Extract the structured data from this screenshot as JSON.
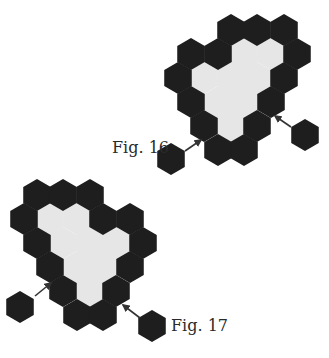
{
  "figures": [
    {
      "id": "fig16",
      "label": "Fig. 16",
      "label_pos": {
        "x": 112,
        "y": 140
      },
      "hex_cells": [
        {
          "x": 231,
          "y": 30,
          "fill": "dark"
        },
        {
          "x": 257,
          "y": 30,
          "fill": "dark"
        },
        {
          "x": 284,
          "y": 30,
          "fill": "dark"
        },
        {
          "x": 191,
          "y": 54,
          "fill": "dark"
        },
        {
          "x": 218,
          "y": 54,
          "fill": "dark"
        },
        {
          "x": 244,
          "y": 54,
          "fill": "light"
        },
        {
          "x": 271,
          "y": 54,
          "fill": "light"
        },
        {
          "x": 297,
          "y": 54,
          "fill": "dark"
        },
        {
          "x": 178,
          "y": 78,
          "fill": "dark"
        },
        {
          "x": 204,
          "y": 78,
          "fill": "light"
        },
        {
          "x": 231,
          "y": 78,
          "fill": "light"
        },
        {
          "x": 257,
          "y": 78,
          "fill": "light"
        },
        {
          "x": 284,
          "y": 78,
          "fill": "dark"
        },
        {
          "x": 191,
          "y": 102,
          "fill": "dark"
        },
        {
          "x": 218,
          "y": 102,
          "fill": "light"
        },
        {
          "x": 244,
          "y": 102,
          "fill": "light"
        },
        {
          "x": 271,
          "y": 102,
          "fill": "dark"
        },
        {
          "x": 204,
          "y": 126,
          "fill": "dark"
        },
        {
          "x": 231,
          "y": 126,
          "fill": "light"
        },
        {
          "x": 257,
          "y": 126,
          "fill": "dark"
        },
        {
          "x": 218,
          "y": 150,
          "fill": "dark"
        },
        {
          "x": 244,
          "y": 150,
          "fill": "dark"
        }
      ],
      "loose_hexes": [
        {
          "x": 171,
          "y": 159
        },
        {
          "x": 305,
          "y": 135
        }
      ],
      "arrows": [
        {
          "x1": 185,
          "y1": 151,
          "x2": 201,
          "y2": 140
        },
        {
          "x1": 291,
          "y1": 127,
          "x2": 275,
          "y2": 116
        }
      ]
    },
    {
      "id": "fig17",
      "label": "Fig. 17",
      "label_pos": {
        "x": 171,
        "y": 318
      },
      "hex_cells": [
        {
          "x": 37,
          "y": 195,
          "fill": "dark"
        },
        {
          "x": 63,
          "y": 195,
          "fill": "dark"
        },
        {
          "x": 90,
          "y": 195,
          "fill": "dark"
        },
        {
          "x": 24,
          "y": 219,
          "fill": "dark"
        },
        {
          "x": 50,
          "y": 219,
          "fill": "light"
        },
        {
          "x": 77,
          "y": 219,
          "fill": "light"
        },
        {
          "x": 103,
          "y": 219,
          "fill": "dark"
        },
        {
          "x": 130,
          "y": 219,
          "fill": "dark"
        },
        {
          "x": 37,
          "y": 243,
          "fill": "dark"
        },
        {
          "x": 63,
          "y": 243,
          "fill": "light"
        },
        {
          "x": 90,
          "y": 243,
          "fill": "light"
        },
        {
          "x": 116,
          "y": 243,
          "fill": "light"
        },
        {
          "x": 143,
          "y": 243,
          "fill": "dark"
        },
        {
          "x": 50,
          "y": 267,
          "fill": "dark"
        },
        {
          "x": 77,
          "y": 267,
          "fill": "light"
        },
        {
          "x": 103,
          "y": 267,
          "fill": "light"
        },
        {
          "x": 130,
          "y": 267,
          "fill": "dark"
        },
        {
          "x": 63,
          "y": 291,
          "fill": "dark"
        },
        {
          "x": 90,
          "y": 291,
          "fill": "light"
        },
        {
          "x": 116,
          "y": 291,
          "fill": "dark"
        },
        {
          "x": 77,
          "y": 315,
          "fill": "dark"
        },
        {
          "x": 103,
          "y": 315,
          "fill": "dark"
        }
      ],
      "loose_hexes": [
        {
          "x": 20,
          "y": 307
        },
        {
          "x": 152,
          "y": 326
        }
      ],
      "arrows": [
        {
          "x1": 35,
          "y1": 296,
          "x2": 51,
          "y2": 283
        },
        {
          "x1": 140,
          "y1": 318,
          "x2": 123,
          "y2": 305
        }
      ]
    }
  ],
  "style": {
    "dark_color": "#1e1e1e",
    "light_color": "#e6e6e6",
    "arrow_color": "#333333",
    "hex_radius": 15.3
  }
}
